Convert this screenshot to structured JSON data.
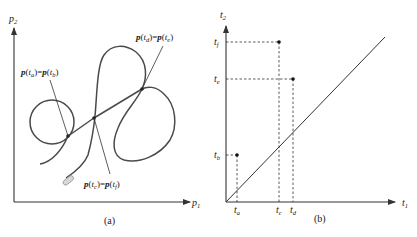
{
  "panel_a": {
    "caption": "(a)",
    "x_axis": {
      "symbol": "p",
      "subscript": "1"
    },
    "y_axis": {
      "symbol": "p",
      "subscript": "2"
    },
    "annotations": [
      {
        "lhs": "p",
        "lhs_sub": "a",
        "rhs": "p",
        "rhs_sub": "b",
        "text": "p(ta)=p(tb)"
      },
      {
        "lhs": "p",
        "lhs_sub": "d",
        "rhs": "p",
        "rhs_sub": "e",
        "text": "p(td)=p(te)"
      },
      {
        "lhs": "p",
        "lhs_sub": "c",
        "rhs": "p",
        "rhs_sub": "f",
        "text": "p(tc)=p(tf)"
      }
    ],
    "colors": {
      "curve": "#4a4a4a",
      "axis": "#333333",
      "start_marker": "#bbbbbb"
    }
  },
  "panel_b": {
    "caption": "(b)",
    "x_axis": {
      "symbol": "t",
      "subscript": "1"
    },
    "y_axis": {
      "symbol": "t",
      "subscript": "2"
    },
    "x_ticks": [
      {
        "symbol": "t",
        "subscript": "a"
      },
      {
        "symbol": "t",
        "subscript": "c"
      },
      {
        "symbol": "t",
        "subscript": "d"
      }
    ],
    "y_ticks": [
      {
        "symbol": "t",
        "subscript": "f"
      },
      {
        "symbol": "t",
        "subscript": "e"
      },
      {
        "symbol": "t",
        "subscript": "b"
      }
    ],
    "points": [
      {
        "x": "ta",
        "y": "tb"
      },
      {
        "x": "tc",
        "y": "tf"
      },
      {
        "x": "td",
        "y": "te"
      }
    ],
    "diagonal": "t2 = t1"
  }
}
